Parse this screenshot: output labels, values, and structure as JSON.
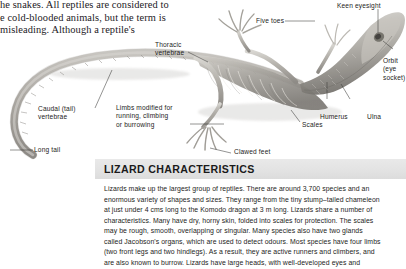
{
  "page": {
    "background": "#ffffff",
    "ink": "#1d1d1b"
  },
  "intro_text": {
    "name": "reptiles-intro-paragraph",
    "clipped_top_line": "legs), for the long animal, the lizard is no",
    "lines": [
      "he snakes. All reptiles are considered to",
      "e cold-blooded animals, but the term is",
      "misleading. Although a reptile's"
    ]
  },
  "figure": {
    "name": "lizard-skeleton-figure",
    "labels": [
      {
        "id": "keen-eyesight",
        "text": "Keen eyesight",
        "lines": [
          "Keen eyesight"
        ]
      },
      {
        "id": "five-toes",
        "text": "Five toes",
        "lines": [
          "Five toes"
        ]
      },
      {
        "id": "thoracic-vertebrae",
        "text": "Thoracic vertebrae",
        "lines": [
          "Thoracic",
          "vertebrae"
        ]
      },
      {
        "id": "orbit-eye-socket",
        "text": "Orbit (eye socket)",
        "lines": [
          "Orbit",
          "(eye",
          "socket)"
        ]
      },
      {
        "id": "caudal-tail-vertebrae",
        "text": "Caudal (tail) vertebrae",
        "lines": [
          "Caudal (tail)",
          "vertebrae"
        ]
      },
      {
        "id": "limbs-modified",
        "text": "Limbs modified for running, climbing or burrowing",
        "lines": [
          "Limbs modified for",
          "running, climbing",
          "or burrowing"
        ]
      },
      {
        "id": "humerus",
        "text": "Humerus",
        "lines": [
          "Humerus"
        ]
      },
      {
        "id": "ulna",
        "text": "Ulna",
        "lines": [
          "Ulna"
        ]
      },
      {
        "id": "scales",
        "text": "Scales",
        "lines": [
          "Scales"
        ]
      },
      {
        "id": "clawed-feet",
        "text": "Clawed feet",
        "lines": [
          "Clawed feet"
        ]
      },
      {
        "id": "long-tail",
        "text": "Long tail",
        "lines": [
          "Long tail"
        ]
      }
    ]
  },
  "section": {
    "name": "lizard-characteristics-section",
    "title": "LIZARD CHARACTERISTICS",
    "band_color": "#e5e5e5",
    "body_lines": [
      "Lizards make up the largest group of reptiles. There are around 3,700 species and an",
      "enormous variety of shapes and sizes. They range from the tiny stump–tailed chameleon",
      "at just under 4 cms long to the Komodo dragon at 3 m long. Lizards share a number of",
      "characteristics. Many have dry, horny skin, folded into scales for protection. The scales",
      "may be rough, smooth, overlapping or singular. Many species also have two glands",
      "called Jacobson's organs, which are used to detect odours. Most species have four limbs",
      "(two front legs and two hindlegs). As a result, they are active runners and climbers, and",
      "are also known to burrow. Lizards have large heads, with well-developed eyes and"
    ]
  }
}
